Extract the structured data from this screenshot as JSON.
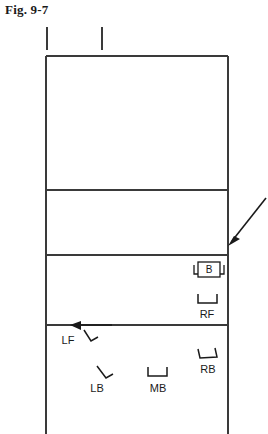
{
  "figure": {
    "caption": "Fig. 9-7",
    "type": "volleyball-court-rotation-diagram"
  },
  "colors": {
    "line": "#3a3a3a",
    "text": "#1a1a1a",
    "background": "#ffffff"
  },
  "court": {
    "name": "volleyball-court",
    "outline": {
      "x": 46,
      "y": 56,
      "width": 182,
      "height": 378
    },
    "horizontal_lines_y": [
      190,
      255,
      325
    ],
    "net_ticks": [
      {
        "x": 47,
        "y_top": 27,
        "y_bottom": 50
      },
      {
        "x": 102,
        "y_top": 27,
        "y_bottom": 50
      }
    ]
  },
  "markers": {
    "setter_box": {
      "label": "B",
      "name": "setter-position-box"
    },
    "players": [
      {
        "label": "RF",
        "name": "right-front-player",
        "mark": "u-bracket"
      },
      {
        "label": "LF",
        "name": "left-front-player",
        "mark": "angled-bracket"
      },
      {
        "label": "LB",
        "name": "left-back-player",
        "mark": "angled-bracket"
      },
      {
        "label": "MB",
        "name": "middle-back-player",
        "mark": "u-bracket"
      },
      {
        "label": "RB",
        "name": "right-back-player",
        "mark": "u-bracket"
      }
    ]
  },
  "arrows": [
    {
      "name": "incoming-ball-arrow",
      "direction": "down-left",
      "from": [
        266,
        198
      ],
      "to": [
        228,
        245
      ]
    },
    {
      "name": "left-front-movement-arrow",
      "direction": "left",
      "from": [
        110,
        325
      ],
      "to": [
        70,
        325
      ]
    }
  ]
}
